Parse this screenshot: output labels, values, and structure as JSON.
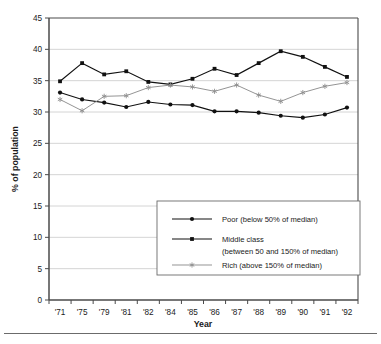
{
  "chart_data": {
    "type": "line",
    "title": "",
    "xlabel": "Year",
    "ylabel": "% of population",
    "ylim": [
      0,
      45
    ],
    "yticks": [
      0,
      5,
      10,
      15,
      20,
      25,
      30,
      35,
      40,
      45
    ],
    "grid": true,
    "grid_axis": "y",
    "legend_position": "inside-lower-right",
    "categories": [
      "'71",
      "'75",
      "'79",
      "'81",
      "'82",
      "'84",
      "'85",
      "'86",
      "'87",
      "'88",
      "'89",
      "'90",
      "'91",
      "'92"
    ],
    "series": [
      {
        "name": "Poor (below 50% of median)",
        "marker": "circle",
        "color": "#111111",
        "values": [
          33.1,
          32.0,
          31.5,
          30.8,
          31.6,
          31.2,
          31.1,
          30.1,
          30.1,
          29.9,
          29.4,
          29.1,
          29.6,
          30.7
        ]
      },
      {
        "name": "Middle class (between 50 and 150% of median)",
        "marker": "square",
        "color": "#111111",
        "values": [
          34.9,
          37.8,
          36.0,
          36.5,
          34.8,
          34.4,
          35.3,
          36.9,
          35.9,
          37.8,
          39.7,
          38.8,
          37.2,
          35.6
        ]
      },
      {
        "name": "Rich (above 150% of median)",
        "marker": "star",
        "color": "#8e8e8e",
        "values": [
          32.0,
          30.2,
          32.5,
          32.6,
          33.9,
          34.3,
          34.0,
          33.3,
          34.3,
          32.7,
          31.7,
          33.1,
          34.1,
          34.7
        ]
      }
    ]
  },
  "axes": {
    "y_title": "% of population",
    "x_title": "Year"
  },
  "legend": {
    "entries": [
      {
        "label_line1": "Poor (below 50% of median)",
        "label_line2": "",
        "marker": "circle",
        "color": "#111111"
      },
      {
        "label_line1": "Middle class",
        "label_line2": "(between 50 and 150% of median)",
        "marker": "square",
        "color": "#111111"
      },
      {
        "label_line1": "Rich (above 150% of median)",
        "label_line2": "",
        "marker": "star",
        "color": "#8e8e8e"
      }
    ]
  },
  "style": {
    "frame_color": "#4a4a4a",
    "grid_color": "#c9c9c9",
    "dark_series_color": "#111111",
    "light_series_color": "#8e8e8e",
    "legend_border_color": "#6b6b6b",
    "background": "#ffffff"
  }
}
